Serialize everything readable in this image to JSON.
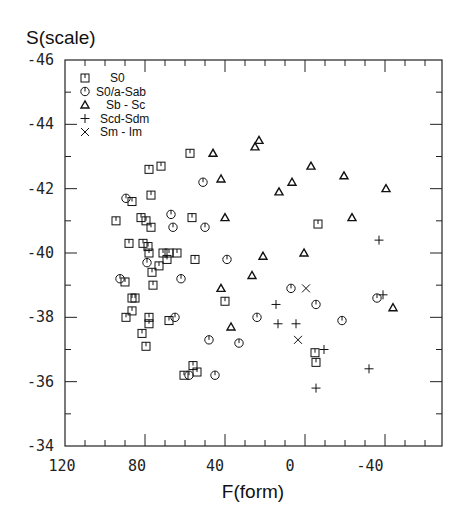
{
  "chart_data": {
    "type": "scatter",
    "title": "",
    "ylabel": "S(scale)",
    "xlabel": "F(form)",
    "xlim": [
      120,
      -69
    ],
    "ylim": [
      -34,
      -46
    ],
    "x_inverted": true,
    "y_inverted": true,
    "x_ticks": [
      120,
      80,
      40,
      0,
      -40
    ],
    "x_tick_labels": [
      "120",
      "80",
      "40",
      "0",
      "-40"
    ],
    "y_ticks": [
      -46,
      -44,
      -42,
      -40,
      -38,
      -36,
      -34
    ],
    "y_tick_labels": [
      "-46",
      "-44",
      "-42",
      "-40",
      "-38",
      "-36",
      "-34"
    ],
    "grid": false,
    "legend_position": "upper-left-inside",
    "series": [
      {
        "name": "S0",
        "marker": "square",
        "points": [
          [
            57.5,
            -43.1
          ],
          [
            78,
            -42.6
          ],
          [
            72,
            -42.7
          ],
          [
            77,
            -41.8
          ],
          [
            86.5,
            -41.6
          ],
          [
            56.5,
            -41.1
          ],
          [
            94.5,
            -41.0
          ],
          [
            82,
            -41.1
          ],
          [
            79.5,
            -41.0
          ],
          [
            77,
            -40.8
          ],
          [
            88,
            -40.3
          ],
          [
            81,
            -40.3
          ],
          [
            78.5,
            -40.2
          ],
          [
            78,
            -40.0
          ],
          [
            71,
            -40.0
          ],
          [
            68,
            -40.0
          ],
          [
            64,
            -40.0
          ],
          [
            69,
            -39.8
          ],
          [
            55,
            -39.8
          ],
          [
            73,
            -39.6
          ],
          [
            76.5,
            -39.4
          ],
          [
            90,
            -39.1
          ],
          [
            76,
            -39.0
          ],
          [
            40,
            -38.5
          ],
          [
            86.5,
            -38.6
          ],
          [
            85,
            -38.6
          ],
          [
            86.5,
            -38.2
          ],
          [
            89.5,
            -38.0
          ],
          [
            78,
            -38.0
          ],
          [
            78,
            -37.8
          ],
          [
            68,
            -37.9
          ],
          [
            81.5,
            -37.5
          ],
          [
            79.5,
            -37.1
          ],
          [
            -5,
            -36.9
          ],
          [
            56,
            -36.5
          ],
          [
            54,
            -36.3
          ],
          [
            60.5,
            -36.2
          ],
          [
            -5.5,
            -36.6
          ],
          [
            -6.5,
            -40.9
          ]
        ]
      },
      {
        "name": "S0/a-Sab",
        "marker": "circle",
        "points": [
          [
            51,
            -42.2
          ],
          [
            89.5,
            -41.7
          ],
          [
            67,
            -41.2
          ],
          [
            66,
            -40.8
          ],
          [
            39,
            -39.8
          ],
          [
            79,
            -39.7
          ],
          [
            92.5,
            -39.2
          ],
          [
            62,
            -39.2
          ],
          [
            50,
            -40.8
          ],
          [
            65,
            -38.0
          ],
          [
            48,
            -37.3
          ],
          [
            33,
            -37.2
          ],
          [
            58,
            -36.2
          ],
          [
            45,
            -36.2
          ],
          [
            24,
            -38.0
          ],
          [
            7,
            -38.9
          ],
          [
            -5.5,
            -38.4
          ],
          [
            -36,
            -38.6
          ],
          [
            -18.5,
            -37.9
          ]
        ]
      },
      {
        "name": "Sb - Sc",
        "marker": "triangle",
        "points": [
          [
            23,
            -43.5
          ],
          [
            25,
            -43.3
          ],
          [
            46,
            -43.1
          ],
          [
            -3,
            -42.7
          ],
          [
            -19.5,
            -42.4
          ],
          [
            -40.5,
            -42.0
          ],
          [
            42,
            -42.3
          ],
          [
            6.5,
            -42.2
          ],
          [
            13,
            -41.9
          ],
          [
            40,
            -41.1
          ],
          [
            -23.5,
            -41.1
          ],
          [
            21,
            -39.9
          ],
          [
            0.5,
            -40.0
          ],
          [
            26.5,
            -39.3
          ],
          [
            42,
            -38.9
          ],
          [
            37,
            -37.7
          ],
          [
            -44,
            -38.3
          ]
        ]
      },
      {
        "name": "Scd-Sdm",
        "marker": "plus",
        "points": [
          [
            -37,
            -40.4
          ],
          [
            -39,
            -38.7
          ],
          [
            14.5,
            -38.4
          ],
          [
            13.5,
            -37.8
          ],
          [
            4.5,
            -37.8
          ],
          [
            -9.5,
            -37.0
          ],
          [
            -32,
            -36.4
          ],
          [
            -5.5,
            -35.8
          ]
        ]
      },
      {
        "name": "Sm - Im",
        "marker": "cross",
        "points": [
          [
            -0.5,
            -38.9
          ],
          [
            3.5,
            -37.3
          ]
        ]
      }
    ]
  },
  "colors": {
    "ink": "#111111",
    "background": "#ffffff"
  }
}
